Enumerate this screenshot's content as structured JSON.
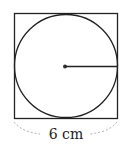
{
  "diagram": {
    "type": "circle inscribed in square",
    "side_label": "6 cm",
    "square": {
      "x": 14,
      "y": 13,
      "size": 103
    },
    "circle": {
      "cx": 65.5,
      "cy": 64.5,
      "r": 51.5
    },
    "radius_line": {
      "from": "center",
      "to": "right edge"
    },
    "colors": {
      "stroke": "#222222",
      "dashed_brace": "#999999",
      "background": "#ffffff"
    }
  }
}
